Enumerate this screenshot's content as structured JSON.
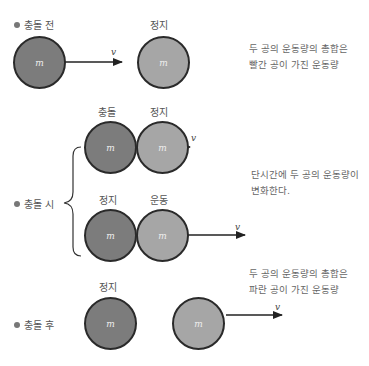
{
  "sections": {
    "before": {
      "bullet_label": "충돌 전",
      "ball_a": {
        "mass": "m",
        "state": ""
      },
      "ball_b": {
        "mass": "m",
        "state": "정지"
      },
      "velocity": "v",
      "description": [
        "두 공의 운동량의 총합은",
        "빨간 공이 가진 운동량"
      ]
    },
    "during": {
      "bullet_label": "충돌 시",
      "row1": {
        "ball_a": {
          "mass": "m",
          "state": "충돌"
        },
        "ball_b": {
          "mass": "m",
          "state": "정지"
        },
        "velocity": "v"
      },
      "row2": {
        "ball_a": {
          "mass": "m",
          "state": "정지"
        },
        "ball_b": {
          "mass": "m",
          "state": "운동"
        },
        "velocity": "v"
      },
      "description": [
        "단시간에 두 공의 운동량이",
        "변화한다."
      ]
    },
    "after": {
      "bullet_label": "충돌 후",
      "ball_a": {
        "mass": "m",
        "state": "정지"
      },
      "ball_b": {
        "mass": "m",
        "state": ""
      },
      "velocity": "v",
      "description": [
        "두 공의 운동량의 총합은",
        "파란 공이 가진 운동량"
      ]
    }
  },
  "colors": {
    "dark_ball": "#7c7c7c",
    "light_ball": "#a6a6a6",
    "outline": "#2a2a2a"
  }
}
